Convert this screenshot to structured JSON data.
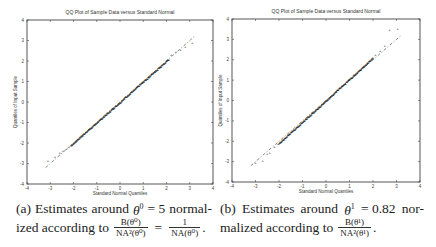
{
  "chart_data": [
    {
      "type": "scatter",
      "panel": "a",
      "title": "QQ Plot of Sample Data versus Standard Normal",
      "xlabel": "Standard Normal Quantiles",
      "ylabel": "Quantiles of Input Sample",
      "xlim": [
        -4,
        4
      ],
      "ylim": [
        -4,
        4
      ],
      "xticks": [
        -4,
        -3,
        -2,
        -1,
        0,
        1,
        2,
        3,
        4
      ],
      "yticks": [
        -4,
        -3,
        -2,
        -1,
        0,
        1,
        2,
        3,
        4
      ],
      "reference_line": {
        "x": [
          -3.2,
          3.2
        ],
        "y": [
          -3.2,
          3.2
        ],
        "style": "dash-dot"
      },
      "tail_points": [
        {
          "x": -3.1,
          "y": -2.85
        },
        {
          "x": -2.8,
          "y": -2.65
        },
        {
          "x": -2.6,
          "y": -2.45
        },
        {
          "x": -2.45,
          "y": -2.35
        },
        {
          "x": -2.3,
          "y": -2.25
        },
        {
          "x": -2.2,
          "y": -2.15
        },
        {
          "x": 2.2,
          "y": 2.3
        },
        {
          "x": 2.4,
          "y": 2.45
        },
        {
          "x": 2.6,
          "y": 2.55
        },
        {
          "x": 2.8,
          "y": 2.7
        },
        {
          "x": 3.1,
          "y": 2.9
        }
      ],
      "body_range": [
        -2.1,
        2.1
      ],
      "body_slope": 1.0,
      "grid": false
    },
    {
      "type": "scatter",
      "panel": "b",
      "title": "QQ Plot of Sample Data versus Standard Normal",
      "xlabel": "Standard Normal Quantiles",
      "ylabel": "Quantiles of Input Sample",
      "xlim": [
        -4,
        4
      ],
      "ylim": [
        -4,
        4
      ],
      "xticks": [
        -4,
        -3,
        -2,
        -1,
        0,
        1,
        2,
        3,
        4
      ],
      "yticks": [
        -4,
        -3,
        -2,
        -1,
        0,
        1,
        2,
        3,
        4
      ],
      "reference_line": {
        "x": [
          -3.2,
          3.2
        ],
        "y": [
          -3.2,
          3.2
        ],
        "style": "dash-dot"
      },
      "tail_points": [
        {
          "x": -3.0,
          "y": -3.05
        },
        {
          "x": -2.7,
          "y": -2.95
        },
        {
          "x": -2.5,
          "y": -2.6
        },
        {
          "x": -2.4,
          "y": -2.55
        },
        {
          "x": -2.2,
          "y": -2.25
        },
        {
          "x": -2.05,
          "y": -2.1
        },
        {
          "x": 2.1,
          "y": 2.25
        },
        {
          "x": 2.3,
          "y": 2.45
        },
        {
          "x": 2.5,
          "y": 2.7
        },
        {
          "x": 2.7,
          "y": 3.5
        },
        {
          "x": 3.05,
          "y": 3.55
        }
      ],
      "body_range": [
        -2.0,
        2.0
      ],
      "body_slope": 1.05,
      "grid": false
    }
  ],
  "captions": {
    "a": {
      "label": "(a)",
      "line1_words": [
        "Estimates",
        "around",
        "θ",
        "= 5",
        "normal-"
      ],
      "line1_sup": "0",
      "line2_prefix": "ized according to",
      "frac1_num": "B(θ⁰)",
      "frac1_den": "NA²(θ⁰)",
      "eq": "=",
      "frac2_num": "1",
      "frac2_den": "NA(θ⁰)",
      "end": "."
    },
    "b": {
      "label": "(b)",
      "line1_words": [
        "Estimates",
        "around",
        "θ",
        "= 0.82",
        "nor-"
      ],
      "line1_sup": "1",
      "line2_prefix": "malized according to",
      "frac1_num": "B(θ¹)",
      "frac1_den": "NA²(θ¹)",
      "end": "."
    }
  }
}
